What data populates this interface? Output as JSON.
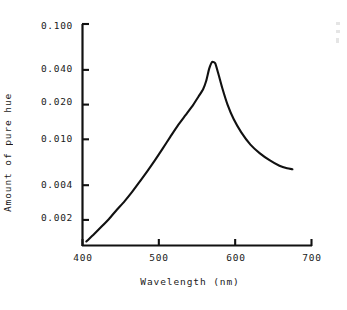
{
  "figure": {
    "background_color": "#ffffff",
    "ink_color": "#111111"
  },
  "axes": {
    "y_title": "Amount of pure hue",
    "x_title": "Wavelength (nm)"
  },
  "ticks": {
    "y_labels": [
      "0.100",
      "0.040",
      "0.020",
      "0.010",
      "0.004",
      "0.002"
    ],
    "x_labels": [
      "400",
      "500",
      "600",
      "700"
    ]
  },
  "chart_data": {
    "type": "line",
    "title": "",
    "subtitle": "",
    "xlabel": "Wavelength (nm)",
    "ylabel": "Amount of pure hue",
    "xscale": "linear",
    "yscale": "log",
    "xlim": [
      400,
      700
    ],
    "ylim": [
      0.0012,
      0.1
    ],
    "grid": false,
    "legend": null,
    "xticks": [
      400,
      500,
      600,
      700
    ],
    "yticks": [
      0.002,
      0.004,
      0.01,
      0.02,
      0.04,
      0.1
    ],
    "ytick_labels": [
      "0.002",
      "0.004",
      "0.010",
      "0.020",
      "0.040",
      "0.100"
    ],
    "annotations": [],
    "series": [
      {
        "name": "Amount of pure hue",
        "color": "#111111",
        "linewidth": 2.1,
        "x": [
          405,
          415,
          425,
          435,
          445,
          455,
          465,
          475,
          485,
          495,
          505,
          515,
          525,
          535,
          545,
          552,
          558,
          562,
          566,
          570,
          574,
          578,
          583,
          590,
          598,
          608,
          620,
          632,
          645,
          658,
          668,
          675
        ],
        "y": [
          0.0013,
          0.0015,
          0.00175,
          0.00205,
          0.00245,
          0.0029,
          0.0035,
          0.0043,
          0.0053,
          0.0066,
          0.0083,
          0.0105,
          0.0132,
          0.0162,
          0.0199,
          0.0235,
          0.0272,
          0.032,
          0.041,
          0.047,
          0.0455,
          0.037,
          0.028,
          0.02,
          0.015,
          0.0115,
          0.009,
          0.0076,
          0.0066,
          0.0059,
          0.0056,
          0.0055
        ]
      }
    ]
  }
}
